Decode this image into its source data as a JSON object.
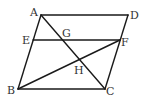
{
  "figure": {
    "type": "parallelogram-diagram",
    "stroke_color": "#1a1a1a",
    "label_color": "#333333",
    "points": {
      "A": "A",
      "B": "B",
      "C": "C",
      "D": "D",
      "E": "E",
      "F": "F",
      "G": "G",
      "H": "H"
    },
    "segments": [
      "AD",
      "BC",
      "AB",
      "DC",
      "EF",
      "AC",
      "BF"
    ]
  }
}
